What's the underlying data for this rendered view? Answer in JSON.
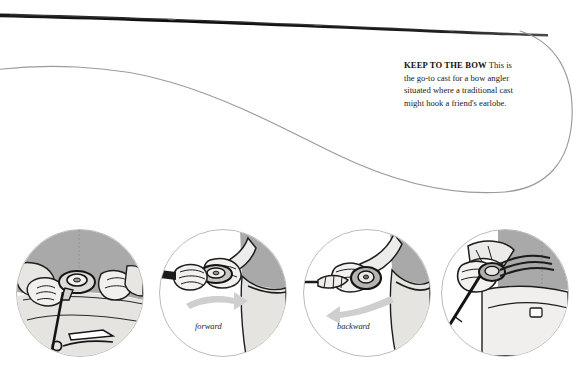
{
  "page": {
    "background_color": "#ffffff"
  },
  "artwork": {
    "rod": {
      "name": "fly-rod",
      "color": "#121212",
      "description": "dark tapered fly rod running across the top of the page"
    },
    "fly_line": {
      "name": "fly-line",
      "color": "#9a9a9a",
      "description": "thin grey fly line sweeping in a long curve and looping at right"
    }
  },
  "caption": {
    "heading": "KEEP TO THE BOW",
    "lead": " This is",
    "lines": [
      "the go-to cast for a bow angler",
      "situated where a traditional cast",
      "might hook a friend's earlobe."
    ],
    "heading_color": "#100f0f",
    "body_color": "#1b1a19"
  },
  "panels": [
    {
      "id": "panel-1",
      "name": "step-1",
      "label": "",
      "description": "Two hands at the reel: left hand grips rod above the reel seat, right hand pinches the fly line"
    },
    {
      "id": "panel-2",
      "name": "step-2",
      "label": "forward",
      "arrow": "arrow-right",
      "arrow_color": "#c9c9c9",
      "description": "Hands pushing the rod grip forward, arrow sweeping to the right"
    },
    {
      "id": "panel-3",
      "name": "step-3",
      "label": "backward",
      "arrow": "arrow-left",
      "arrow_color": "#c9c9c9",
      "description": "Hand drawing the line back past the reel, arrow sweeping to the lower left"
    },
    {
      "id": "panel-4",
      "name": "step-4",
      "label": "",
      "description": "Loaded rod held low with the line pulled tight, ready to release"
    }
  ],
  "palette": {
    "ink": "#121212",
    "line_grey": "#9a9a9a",
    "panel_rule": "#bdbcbb",
    "shade_mid": "#a9a9a9",
    "shade_light": "#e6e4e1",
    "arrow": "#c9c9c9"
  }
}
